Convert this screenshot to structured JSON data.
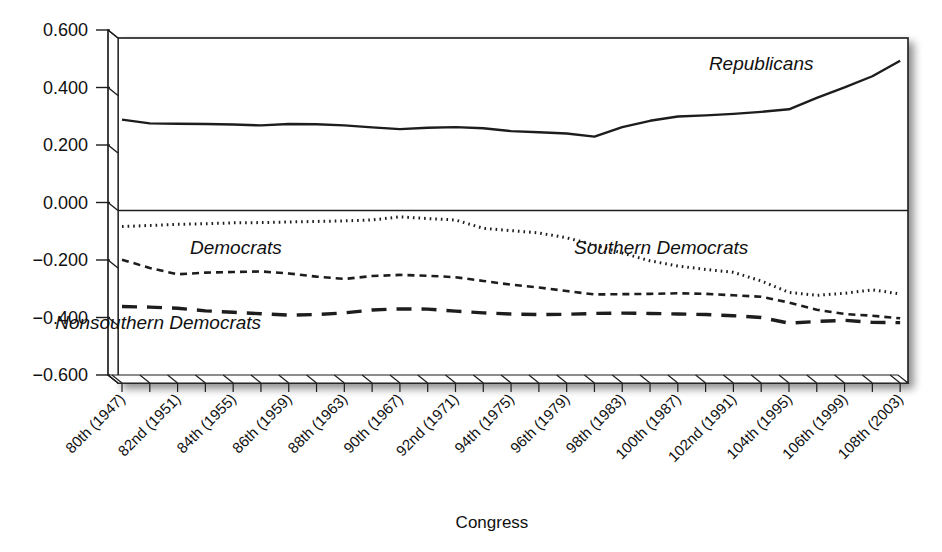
{
  "chart_data": {
    "type": "line",
    "title": "",
    "xlabel": "Congress",
    "ylabel": "",
    "ylim": [
      -0.6,
      0.6
    ],
    "grid": false,
    "legend_position": "inline-annotations",
    "y_ticks": [
      "0.600",
      "0.400",
      "0.200",
      "0.000",
      "-0.200",
      "-0.400",
      "-0.600"
    ],
    "y_tick_values": [
      0.6,
      0.4,
      0.2,
      0.0,
      -0.2,
      -0.4,
      -0.6
    ],
    "categories": [
      "80th (1947)",
      "81st (1949)",
      "82nd (1951)",
      "83rd (1953)",
      "84th (1955)",
      "85th (1957)",
      "86th (1959)",
      "87th (1961)",
      "88th (1963)",
      "89th (1965)",
      "90th (1967)",
      "91st (1969)",
      "92nd (1971)",
      "93rd (1973)",
      "94th (1975)",
      "95th (1977)",
      "96th (1979)",
      "97th (1981)",
      "98th (1983)",
      "99th (1985)",
      "100th (1987)",
      "101st (1989)",
      "102nd (1991)",
      "103rd (1993)",
      "104th (1995)",
      "105th (1997)",
      "106th (1999)",
      "107th (2001)",
      "108th (2003)"
    ],
    "visible_tick_labels": [
      "80th (1947)",
      "82nd (1951)",
      "84th (1955)",
      "86th (1959)",
      "88th (1963)",
      "90th (1967)",
      "92nd (1971)",
      "94th (1975)",
      "96th (1979)",
      "98th (1983)",
      "100th (1987)",
      "102nd (1991)",
      "104th (1995)",
      "106th (1999)",
      "108th (2003)"
    ],
    "series": [
      {
        "name": "Republicans",
        "line_style": "solid",
        "color": "#1d1d1d",
        "values": [
          0.316,
          0.303,
          0.302,
          0.301,
          0.299,
          0.296,
          0.301,
          0.3,
          0.296,
          0.289,
          0.283,
          0.288,
          0.29,
          0.286,
          0.276,
          0.272,
          0.268,
          0.257,
          0.29,
          0.312,
          0.327,
          0.331,
          0.336,
          0.343,
          0.352,
          0.392,
          0.428,
          0.467,
          0.521
        ]
      },
      {
        "name": "Southern Democrats",
        "line_style": "dotted",
        "color": "#1d1d1d",
        "values": [
          -0.056,
          -0.052,
          -0.048,
          -0.046,
          -0.043,
          -0.042,
          -0.04,
          -0.038,
          -0.036,
          -0.033,
          -0.022,
          -0.028,
          -0.033,
          -0.062,
          -0.07,
          -0.078,
          -0.095,
          -0.12,
          -0.148,
          -0.175,
          -0.193,
          -0.205,
          -0.215,
          -0.245,
          -0.285,
          -0.295,
          -0.288,
          -0.276,
          -0.29
        ]
      },
      {
        "name": "Democrats",
        "line_style": "dashed",
        "color": "#1d1d1d",
        "values": [
          -0.171,
          -0.2,
          -0.222,
          -0.216,
          -0.214,
          -0.212,
          -0.219,
          -0.23,
          -0.238,
          -0.228,
          -0.224,
          -0.227,
          -0.232,
          -0.245,
          -0.258,
          -0.268,
          -0.28,
          -0.292,
          -0.291,
          -0.29,
          -0.288,
          -0.29,
          -0.295,
          -0.3,
          -0.32,
          -0.345,
          -0.36,
          -0.366,
          -0.375
        ]
      },
      {
        "name": "Nonsouthern Democrats",
        "line_style": "long-dashed",
        "color": "#1d1d1d",
        "values": [
          -0.334,
          -0.336,
          -0.34,
          -0.349,
          -0.354,
          -0.359,
          -0.364,
          -0.362,
          -0.356,
          -0.346,
          -0.342,
          -0.343,
          -0.35,
          -0.356,
          -0.36,
          -0.362,
          -0.361,
          -0.358,
          -0.357,
          -0.358,
          -0.36,
          -0.362,
          -0.366,
          -0.372,
          -0.392,
          -0.386,
          -0.382,
          -0.389,
          -0.39
        ]
      }
    ],
    "annotations": [
      {
        "text": "Republicans",
        "x_index": 23.0,
        "y_value": 0.488
      },
      {
        "text": "Southern Democrats",
        "x_index": 19.4,
        "y_value": -0.15
      },
      {
        "text": "Democrats",
        "x_index": 4.1,
        "y_value": -0.152
      },
      {
        "text": "Nonsouthern Democrats",
        "x_index": 1.3,
        "y_value": -0.412
      }
    ]
  }
}
